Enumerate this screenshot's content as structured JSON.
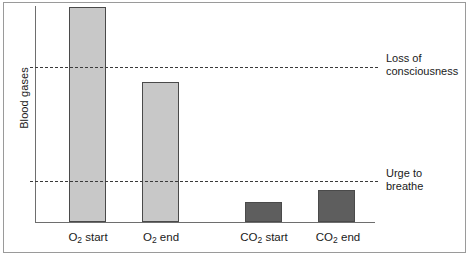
{
  "chart_data": {
    "type": "bar",
    "title": "",
    "xlabel": "",
    "ylabel": "Blood gases",
    "categories": [
      "O2 start",
      "O2 end",
      "CO2 start",
      "CO2 end"
    ],
    "category_labels_html": [
      {
        "main": "O",
        "sub": "2",
        "rest": " start"
      },
      {
        "main": "O",
        "sub": "2",
        "rest": " end"
      },
      {
        "main": "CO",
        "sub": "2",
        "rest": " start"
      },
      {
        "main": "CO",
        "sub": "2",
        "rest": " end"
      }
    ],
    "values": [
      100,
      65,
      9,
      15
    ],
    "ylim": [
      0,
      104
    ],
    "grid": false,
    "legend": "none",
    "series": [
      {
        "name": "Blood gases",
        "values": [
          100,
          65,
          9,
          15
        ],
        "colors": [
          "#c8c8c8",
          "#c8c8c8",
          "#5e5e5e",
          "#5e5e5e"
        ]
      }
    ],
    "bar_colors": {
      "oxygen": "#c8c8c8",
      "carbon_dioxide": "#5e5e5e",
      "bar_outline": "#4a4a4a"
    },
    "annotations": [
      {
        "id": "loss-of-consciousness",
        "label_line1": "Loss of",
        "label_line2": "consciousness",
        "value": 71
      },
      {
        "id": "urge-to-breathe",
        "label_line1": "Urge to",
        "label_line2": "breathe",
        "value": 19
      }
    ],
    "axis_color": "#6e6e6e"
  },
  "geometry": {
    "bars": [
      {
        "left": 69,
        "width": 37,
        "top": 7,
        "height": 215,
        "color": "#c8c8c8",
        "name": "bar-o2-start"
      },
      {
        "left": 142,
        "width": 37,
        "top": 82,
        "height": 140,
        "color": "#c8c8c8",
        "name": "bar-o2-end"
      },
      {
        "left": 245,
        "width": 37,
        "top": 202,
        "height": 20,
        "color": "#5e5e5e",
        "name": "bar-co2-start"
      },
      {
        "left": 318,
        "width": 37,
        "top": 190,
        "height": 32,
        "color": "#5e5e5e",
        "name": "bar-co2-end"
      }
    ],
    "threshold_lines": [
      {
        "top": 67,
        "width": 348,
        "name": "threshold-line-loss-of-consciousness"
      },
      {
        "top": 181,
        "width": 348,
        "name": "threshold-line-urge-to-breathe"
      }
    ],
    "threshold_labels": [
      {
        "left": 386,
        "top": 52,
        "name": "threshold-label-loss-of-consciousness"
      },
      {
        "left": 386,
        "top": 167,
        "name": "threshold-label-urge-to-breathe"
      }
    ],
    "cat_label_positions": [
      {
        "left": 57,
        "width": 62
      },
      {
        "left": 132,
        "width": 58
      },
      {
        "left": 229,
        "width": 70
      },
      {
        "left": 305,
        "width": 66
      }
    ]
  }
}
